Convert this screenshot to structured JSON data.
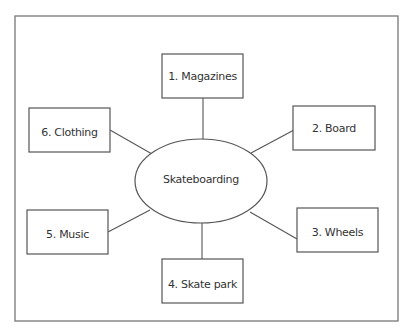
{
  "diagram": {
    "type": "mind-map",
    "center": {
      "label": "Skateboarding"
    },
    "nodes": [
      {
        "label": "1. Magazines"
      },
      {
        "label": "2. Board"
      },
      {
        "label": "3. Wheels"
      },
      {
        "label": "4. Skate park"
      },
      {
        "label": "5. Music"
      },
      {
        "label": "6. Clothing"
      }
    ]
  }
}
